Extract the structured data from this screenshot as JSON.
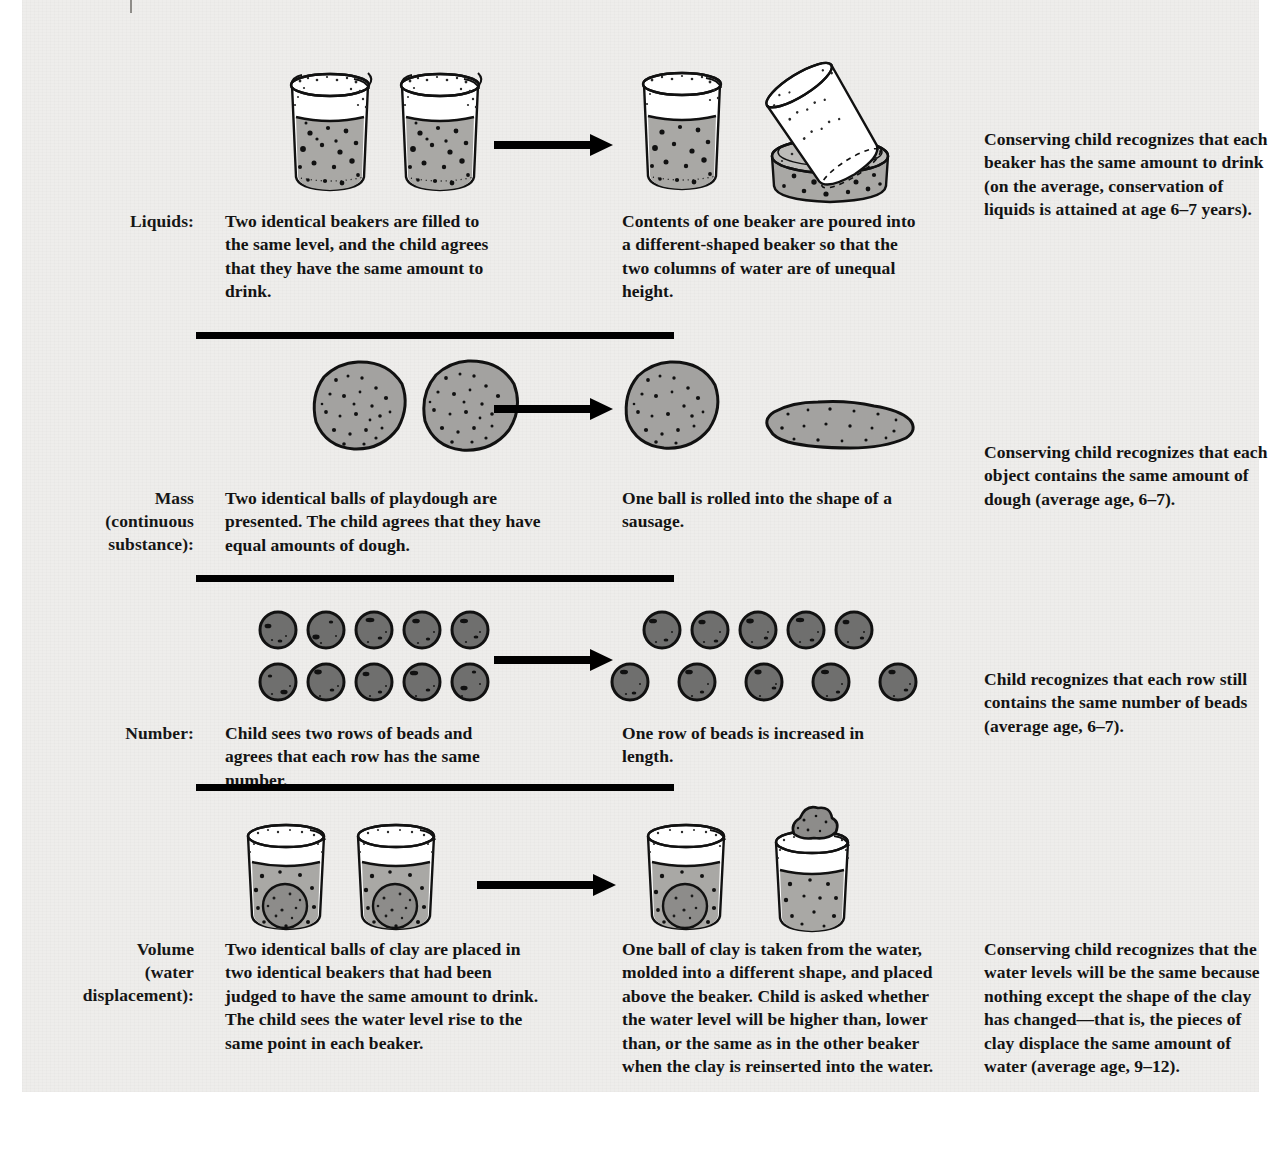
{
  "figure": {
    "background_color": "#eeedeb",
    "divider_color": "#000000",
    "water_fill_color": "#a9a8a5",
    "dough_fill_color": "#a3a2a0",
    "bead_fill_color": "#6f6f6e",
    "outline_color": "#111111"
  },
  "rows": [
    {
      "id": "liquids",
      "label": "Liquids:",
      "label_lines": [
        "Liquids:"
      ],
      "left_text": "Two identical beakers are filled to the same level, and the child agrees that they have the same amount to drink.",
      "middle_text": "Contents of one beaker are poured into a different-shaped beaker so that the two columns of water are of unequal height.",
      "right_text": "Conserving child recognizes that each beaker has the same amount to drink (on the average, conservation of liquids is attained at age 6–7 years).",
      "art_left": "two-identical-beakers",
      "art_right": "beaker-poured-into-wide-dish"
    },
    {
      "id": "mass",
      "label": "Mass (continuous substance):",
      "label_lines": [
        "Mass",
        "(continuous",
        "substance):"
      ],
      "left_text": "Two identical balls of playdough are presented. The child agrees that they have equal amounts of dough.",
      "middle_text": "One ball is rolled into the shape of a sausage.",
      "right_text": "Conserving child recognizes that each object contains the same amount of dough (average age, 6–7).",
      "art_left": "two-playdough-balls",
      "art_right": "ball-and-sausage"
    },
    {
      "id": "number",
      "label": "Number:",
      "label_lines": [
        "Number:"
      ],
      "left_text": "Child sees two rows of beads and agrees that each row has the same number.",
      "middle_text": "One row of beads is increased in length.",
      "right_text": "Child recognizes that each row still contains the same number of beads (average age, 6–7).",
      "art_left": "two-equal-rows-of-beads",
      "art_right": "two-rows-one-spread-out",
      "beads_per_row": 5
    },
    {
      "id": "volume",
      "label": "Volume (water displacement):",
      "label_lines": [
        "Volume",
        "(water",
        "displacement):"
      ],
      "left_text": "Two identical balls of clay are placed in two identical beakers that had been judged to have the same amount to drink. The child sees the water level rise to the same point in each beaker.",
      "middle_text": "One ball of clay is taken from the water, molded into a different shape, and placed above the beaker. Child is asked whether the water level will be higher than, lower than, or the same as in the other beaker when the clay is reinserted into the water.",
      "right_text": "Conserving child recognizes that the water levels will be the same because nothing except the shape of the clay has changed—that is, the pieces of clay displace the same amount of water (average age, 9–12).",
      "art_left": "two-beakers-with-clay-balls",
      "art_right": "beaker-with-clay-and-beaker-with-clay-above"
    }
  ]
}
